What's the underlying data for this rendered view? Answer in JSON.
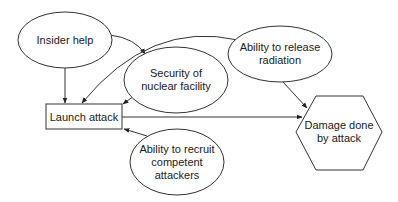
{
  "diagram": {
    "type": "influence-diagram",
    "nodes": [
      {
        "id": "insider_help",
        "shape": "ellipse",
        "label": "Insider help"
      },
      {
        "id": "security",
        "shape": "ellipse",
        "label_lines": [
          "Security of",
          "nuclear facility"
        ]
      },
      {
        "id": "radiation",
        "shape": "ellipse",
        "label_lines": [
          "Ability to release",
          "radiation"
        ]
      },
      {
        "id": "launch",
        "shape": "rectangle",
        "label": "Launch attack"
      },
      {
        "id": "recruit",
        "shape": "ellipse",
        "label_lines": [
          "Ability to recruit",
          "competent",
          "attackers"
        ]
      },
      {
        "id": "damage",
        "shape": "hexagon",
        "label_lines": [
          "Damage done",
          "by attack"
        ]
      }
    ],
    "edges": [
      {
        "from": "insider_help",
        "to": "launch"
      },
      {
        "from": "insider_help",
        "to": "security"
      },
      {
        "from": "radiation",
        "to": "launch"
      },
      {
        "from": "security",
        "to": "launch"
      },
      {
        "from": "recruit",
        "to": "launch"
      },
      {
        "from": "launch",
        "to": "damage"
      },
      {
        "from": "radiation",
        "to": "damage"
      }
    ],
    "colors": {
      "stroke": "#333333",
      "background": "#ffffff",
      "text": "#1a1a1a"
    }
  }
}
